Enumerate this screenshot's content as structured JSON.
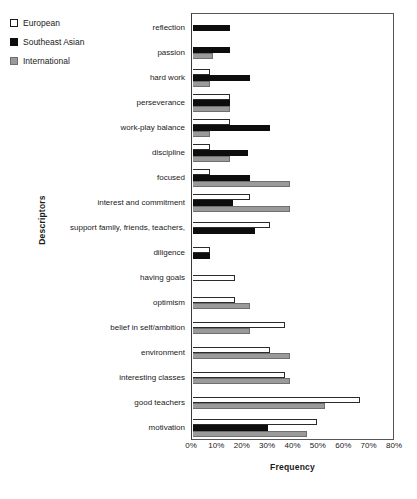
{
  "chart_data": {
    "type": "bar",
    "orientation": "horizontal",
    "title": "",
    "xlabel": "Frequency",
    "ylabel": "Descriptors",
    "xlim": [
      0,
      80
    ],
    "xtick_labels": [
      "0%",
      "10%",
      "20%",
      "30%",
      "40%",
      "50%",
      "60%",
      "70%",
      "80%"
    ],
    "xtick_values": [
      0,
      10,
      20,
      30,
      40,
      50,
      60,
      70,
      80
    ],
    "grid": false,
    "legend_position": "top-left",
    "categories": [
      "reflection",
      "passion",
      "hard work",
      "perseverance",
      "work-play balance",
      "discipline",
      "focused",
      "interest and commitment",
      "support family, friends, teachers,",
      "diligence",
      "having goals",
      "optimism",
      "belief in self/ambition",
      "environment",
      "interesting classes",
      "good teachers",
      "motivation"
    ],
    "series": [
      {
        "name": "European",
        "key": "european",
        "color": "#ffffff",
        "values": [
          0,
          0,
          7,
          15,
          15,
          7,
          7,
          23,
          31,
          7,
          17,
          17,
          37,
          31,
          37,
          67,
          50
        ]
      },
      {
        "name": "Southeast Asian",
        "key": "southeastasian",
        "color": "#0d0d0d",
        "values": [
          15,
          15,
          23,
          15,
          31,
          22,
          23,
          16,
          25,
          7,
          0,
          0,
          0,
          0,
          0,
          0,
          30
        ]
      },
      {
        "name": "International",
        "key": "international",
        "color": "#9a9a9a",
        "values": [
          0,
          8,
          7,
          15,
          7,
          15,
          39,
          39,
          0,
          0,
          0,
          23,
          23,
          39,
          39,
          53,
          46
        ]
      }
    ]
  },
  "legend": {
    "items": [
      {
        "label": "European",
        "swatch": "legend-swatch-european"
      },
      {
        "label": "Southeast Asian",
        "swatch": "legend-swatch-southeast-asian"
      },
      {
        "label": "International",
        "swatch": "legend-swatch-international"
      }
    ]
  }
}
